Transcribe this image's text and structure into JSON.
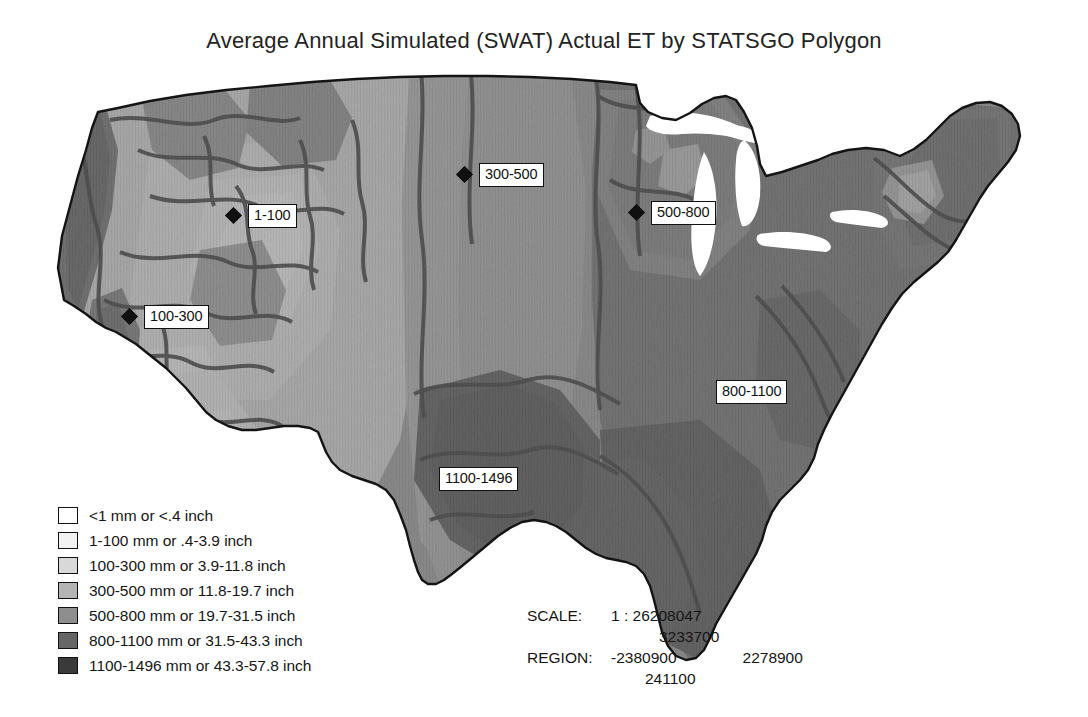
{
  "title": "Average Annual Simulated (SWAT) Actual ET by STATSGO Polygon",
  "map": {
    "name": "conterminous-united-states",
    "labels": [
      {
        "id": "l-300-500",
        "text": "300-500",
        "x": 459,
        "y": 163,
        "marker": true
      },
      {
        "id": "l-500-800",
        "text": "500-800",
        "x": 631,
        "y": 201,
        "marker": true
      },
      {
        "id": "l-1-100",
        "text": "1-100",
        "x": 228,
        "y": 204,
        "marker": true
      },
      {
        "id": "l-100-300",
        "text": "100-300",
        "x": 124,
        "y": 305,
        "marker": true
      },
      {
        "id": "l-800-1100",
        "text": "800-1100",
        "x": 716,
        "y": 380,
        "marker": false
      },
      {
        "id": "l-1100-1496",
        "text": "1100-1496",
        "x": 439,
        "y": 467,
        "marker": false
      }
    ]
  },
  "legend": {
    "name": "et-class-legend",
    "items": [
      {
        "label": "<1 mm or <.4 inch",
        "color": "#ffffff"
      },
      {
        "label": "1-100 mm or .4-3.9 inch",
        "color": "#f2f2f2"
      },
      {
        "label": "100-300 mm or 3.9-11.8 inch",
        "color": "#d8d8d8"
      },
      {
        "label": "300-500 mm or 11.8-19.7 inch",
        "color": "#b4b4b4"
      },
      {
        "label": "500-800 mm or 19.7-31.5 inch",
        "color": "#8e8e8e"
      },
      {
        "label": "800-1100 mm or 31.5-43.3 inch",
        "color": "#666666"
      },
      {
        "label": "1100-1496 mm or 43.3-57.8 inch",
        "color": "#3a3a3a"
      }
    ]
  },
  "scale": {
    "scale_key": "SCALE:",
    "scale_value": "1 : 26208047",
    "region_key": "REGION:",
    "region_top": "3233700",
    "region_left": "-2380900",
    "region_right": "2278900",
    "region_bottom": "241100"
  }
}
